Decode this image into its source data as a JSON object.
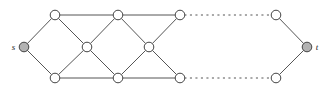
{
  "figure": {
    "name": "graph-diagram",
    "type": "undirected-graph",
    "width": 333,
    "height": 92,
    "background_color": "#ffffff",
    "edge_color": "#555555",
    "node_stroke_color": "#444444",
    "node_fill_white": "#ffffff",
    "node_fill_terminal": "#b3b3b3",
    "node_radius": 4.8,
    "terminal_radius": 4.8,
    "edge_width": 1,
    "dash_pattern": "1.3 4.2"
  },
  "labels": {
    "source": "s",
    "sink": "t"
  },
  "nodes": [
    {
      "id": "s",
      "name": "node-s",
      "cx": 24,
      "cy": 47,
      "fill": "terminal",
      "label": "s",
      "label_side": "left"
    },
    {
      "id": "t",
      "name": "node-t",
      "cx": 307,
      "cy": 47,
      "fill": "terminal",
      "label": "t",
      "label_side": "right"
    },
    {
      "id": "u1",
      "name": "node-top-1",
      "cx": 55,
      "cy": 15,
      "fill": "white",
      "label": "",
      "label_side": ""
    },
    {
      "id": "u2",
      "name": "node-top-2",
      "cx": 118,
      "cy": 15,
      "fill": "white",
      "label": "",
      "label_side": ""
    },
    {
      "id": "u3",
      "name": "node-top-3",
      "cx": 180,
      "cy": 15,
      "fill": "white",
      "label": "",
      "label_side": ""
    },
    {
      "id": "u4",
      "name": "node-top-4",
      "cx": 276,
      "cy": 15,
      "fill": "white",
      "label": "",
      "label_side": ""
    },
    {
      "id": "m1",
      "name": "node-middle-1",
      "cx": 87,
      "cy": 47,
      "fill": "white",
      "label": "",
      "label_side": ""
    },
    {
      "id": "m2",
      "name": "node-middle-2",
      "cx": 149,
      "cy": 47,
      "fill": "white",
      "label": "",
      "label_side": ""
    },
    {
      "id": "d1",
      "name": "node-bottom-1",
      "cx": 55,
      "cy": 78,
      "fill": "white",
      "label": "",
      "label_side": ""
    },
    {
      "id": "d2",
      "name": "node-bottom-2",
      "cx": 118,
      "cy": 78,
      "fill": "white",
      "label": "",
      "label_side": ""
    },
    {
      "id": "d3",
      "name": "node-bottom-3",
      "cx": 180,
      "cy": 78,
      "fill": "white",
      "label": "",
      "label_side": ""
    },
    {
      "id": "d4",
      "name": "node-bottom-4",
      "cx": 276,
      "cy": 78,
      "fill": "white",
      "label": "",
      "label_side": ""
    }
  ],
  "edges": [
    {
      "name": "edge-s-top1",
      "from": "s",
      "to": "u1",
      "style": "solid"
    },
    {
      "name": "edge-s-bottom1",
      "from": "s",
      "to": "d1",
      "style": "solid"
    },
    {
      "name": "edge-top1-top2",
      "from": "u1",
      "to": "u2",
      "style": "solid"
    },
    {
      "name": "edge-top2-top3",
      "from": "u2",
      "to": "u3",
      "style": "solid"
    },
    {
      "name": "edge-top3-top4",
      "from": "u3",
      "to": "u4",
      "style": "dotted"
    },
    {
      "name": "edge-bottom1-bottom2",
      "from": "d1",
      "to": "d2",
      "style": "solid"
    },
    {
      "name": "edge-bottom2-bottom3",
      "from": "d2",
      "to": "d3",
      "style": "solid"
    },
    {
      "name": "edge-bottom3-bottom4",
      "from": "d3",
      "to": "d4",
      "style": "dotted"
    },
    {
      "name": "edge-top1-middle1",
      "from": "u1",
      "to": "m1",
      "style": "solid"
    },
    {
      "name": "edge-bottom1-middle1",
      "from": "d1",
      "to": "m1",
      "style": "solid"
    },
    {
      "name": "edge-middle1-top2",
      "from": "m1",
      "to": "u2",
      "style": "solid"
    },
    {
      "name": "edge-middle1-bottom2",
      "from": "m1",
      "to": "d2",
      "style": "solid"
    },
    {
      "name": "edge-top2-middle2",
      "from": "u2",
      "to": "m2",
      "style": "solid"
    },
    {
      "name": "edge-bottom2-middle2",
      "from": "d2",
      "to": "m2",
      "style": "solid"
    },
    {
      "name": "edge-middle2-top3",
      "from": "m2",
      "to": "u3",
      "style": "solid"
    },
    {
      "name": "edge-middle2-bottom3",
      "from": "m2",
      "to": "d3",
      "style": "solid"
    },
    {
      "name": "edge-top4-t",
      "from": "u4",
      "to": "t",
      "style": "solid"
    },
    {
      "name": "edge-bottom4-t",
      "from": "d4",
      "to": "t",
      "style": "solid"
    }
  ]
}
